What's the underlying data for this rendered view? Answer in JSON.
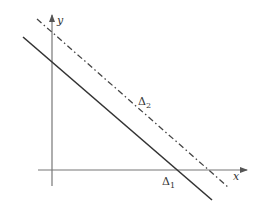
{
  "diagram": {
    "axes": {
      "x_label": "x",
      "y_label": "y",
      "color": "#555555"
    },
    "lines": [
      {
        "name": "Δ1",
        "symbol": "Δ",
        "subscript": "1",
        "style": "solid",
        "color": "#333333"
      },
      {
        "name": "Δ2",
        "symbol": "Δ",
        "subscript": "2",
        "style": "dash-dot",
        "color": "#444444"
      }
    ]
  }
}
